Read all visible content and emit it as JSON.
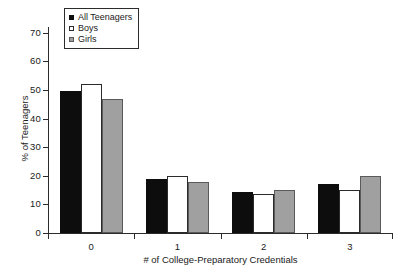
{
  "chart_data": {
    "type": "bar",
    "title": "",
    "subtitle": "",
    "xlabel": "# of College-Preparatory Credentials",
    "ylabel": "% of Teenagers",
    "categories": [
      "0",
      "1",
      "2",
      "3"
    ],
    "series": [
      {
        "name": "All Teenagers",
        "color": "#0d0d0d",
        "values": [
          49.5,
          19.0,
          14.5,
          17.0
        ]
      },
      {
        "name": "Boys",
        "color": "#ffffff",
        "values": [
          52.0,
          20.0,
          13.5,
          15.0
        ]
      },
      {
        "name": "Girls",
        "color": "#a0a0a0",
        "values": [
          47.0,
          18.0,
          15.0,
          20.0
        ]
      }
    ],
    "ylim": [
      0,
      72
    ],
    "yticks": [
      0,
      10,
      20,
      30,
      40,
      50,
      60,
      70
    ],
    "ytick_labels": [
      "0",
      "10",
      "20",
      "30",
      "40",
      "50",
      "60",
      "70"
    ],
    "xtick_labels": [
      "0",
      "1",
      "2",
      "3"
    ],
    "grid": false,
    "legend_position": "top-left",
    "legend_entries": [
      "All Teenagers",
      "Boys",
      "Girls"
    ],
    "annotations": []
  },
  "axis": {
    "y_title": "% of Teenagers",
    "x_title": "# of College-Preparatory Credentials"
  }
}
